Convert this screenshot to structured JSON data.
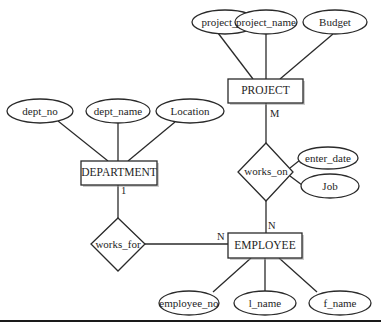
{
  "diagram": {
    "type": "er-diagram",
    "entities": [
      {
        "id": "project",
        "label": "PROJECT"
      },
      {
        "id": "department",
        "label": "DEPARTMENT"
      },
      {
        "id": "employee",
        "label": "EMPLOYEE"
      }
    ],
    "relationships": [
      {
        "id": "works_on",
        "label": "works_on",
        "connects": [
          "PROJECT",
          "EMPLOYEE"
        ],
        "cardinality": {
          "PROJECT": "M",
          "EMPLOYEE": "N"
        }
      },
      {
        "id": "works_for",
        "label": "works_for",
        "connects": [
          "DEPARTMENT",
          "EMPLOYEE"
        ],
        "cardinality": {
          "DEPARTMENT": "1",
          "EMPLOYEE": "N"
        }
      }
    ],
    "attributes": {
      "project": [
        "project_no",
        "project_name",
        "Budget"
      ],
      "department": [
        "dept_no",
        "dept_name",
        "Location"
      ],
      "employee": [
        "employee_no",
        "l_name",
        "f_name"
      ],
      "works_on": [
        "enter_date",
        "Job"
      ]
    },
    "cardinality_labels": {
      "project_works_on": "M",
      "works_on_employee": "N",
      "department_works_for": "1",
      "works_for_employee": "N"
    }
  }
}
